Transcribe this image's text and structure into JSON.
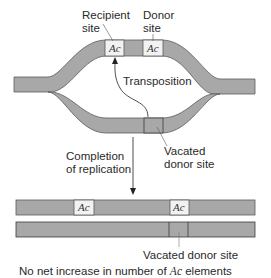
{
  "colors": {
    "dna_fill": "#a8a8a8",
    "dna_stroke": "#5a5a5a",
    "element_fill": "#f2f2f2",
    "text": "#2a2a2a",
    "background": "#ffffff"
  },
  "labels": {
    "recipient_site_line1": "Recipient",
    "recipient_site_line2": "site",
    "donor_site_line1": "Donor",
    "donor_site_line2": "site",
    "transposition": "Transposition",
    "vacated_donor_site_line1": "Vacated",
    "vacated_donor_site_line2": "donor site",
    "completion_line1": "Completion",
    "completion_line2": "of replication",
    "vacated_donor_site_bottom": "Vacated donor site",
    "conclusion_prefix": "No net increase in number of ",
    "conclusion_element": "Ac",
    "conclusion_suffix": " elements"
  },
  "elements": {
    "recipient_ac": "Ac",
    "donor_ac": "Ac",
    "product1_ac_left": "Ac",
    "product1_ac_right": "Ac"
  }
}
